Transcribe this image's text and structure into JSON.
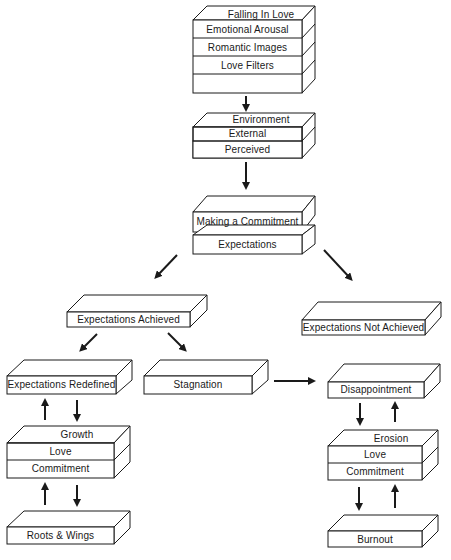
{
  "stack_falling": {
    "rows": [
      "Falling In Love",
      "Emotional Arousal",
      "Romantic Images",
      "Love Filters"
    ]
  },
  "stack_environment": {
    "rows": [
      "Environment",
      "External",
      "Perceived"
    ]
  },
  "stack_commitment": {
    "top": "Making a Commitment",
    "bottom": "Expectations"
  },
  "box_achieved": {
    "label": "Expectations Achieved"
  },
  "box_not_achieved": {
    "label": "Expectations Not Achieved"
  },
  "box_redefined": {
    "label": "Expectations Redefined"
  },
  "box_stagnation": {
    "label": "Stagnation"
  },
  "box_disappointment": {
    "label": "Disappointment"
  },
  "stack_growth": {
    "rows": [
      "Growth",
      "Love",
      "Commitment"
    ]
  },
  "stack_erosion": {
    "rows": [
      "Erosion",
      "Love",
      "Commitment"
    ]
  },
  "box_roots": {
    "label": "Roots & Wings"
  },
  "box_burnout": {
    "label": "Burnout"
  },
  "colors": {
    "line": "#1a1a1a",
    "background": "#ffffff"
  }
}
